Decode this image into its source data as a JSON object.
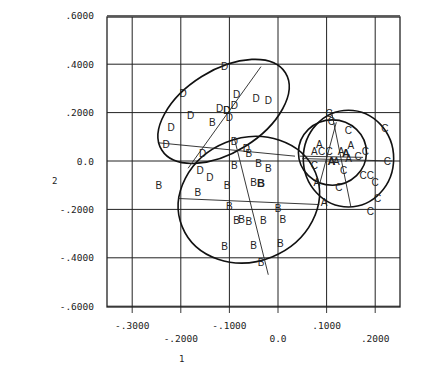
{
  "chart_data": {
    "type": "scatter",
    "title": "",
    "xlabel": "1",
    "ylabel": "2",
    "xlim": [
      -0.35,
      0.25
    ],
    "ylim": [
      -0.6,
      0.6
    ],
    "grid": true,
    "legend": null,
    "x_ticks": [
      {
        "value": -0.3,
        "label": "-.3000",
        "row": 0
      },
      {
        "value": -0.2,
        "label": "-.2000",
        "row": 1
      },
      {
        "value": -0.1,
        "label": "-.1000",
        "row": 0
      },
      {
        "value": 0.0,
        "label": "0.0",
        "row": 1
      },
      {
        "value": 0.1,
        "label": ".1000",
        "row": 0
      },
      {
        "value": 0.2,
        "label": ".2000",
        "row": 1
      }
    ],
    "y_ticks": [
      {
        "value": 0.6,
        "label": ".6000"
      },
      {
        "value": 0.4,
        "label": ".4000"
      },
      {
        "value": 0.2,
        "label": ".2000"
      },
      {
        "value": 0.0,
        "label": "0.0"
      },
      {
        "value": -0.2,
        "label": "-.2000"
      },
      {
        "value": -0.4,
        "label": "-.4000"
      },
      {
        "value": -0.6,
        "label": "-.6000"
      }
    ],
    "series": [
      {
        "name": "D",
        "points": [
          [
            -0.11,
            0.39
          ],
          [
            -0.18,
            0.19
          ],
          [
            -0.22,
            0.14
          ],
          [
            -0.23,
            0.07
          ],
          [
            -0.195,
            0.28
          ],
          [
            -0.12,
            0.215
          ],
          [
            -0.105,
            0.21
          ],
          [
            -0.085,
            0.275
          ],
          [
            -0.09,
            0.23
          ],
          [
            -0.1,
            0.18
          ],
          [
            -0.045,
            0.26
          ],
          [
            -0.02,
            0.25
          ],
          [
            -0.09,
            0.08
          ],
          [
            -0.155,
            0.03
          ],
          [
            -0.065,
            0.05
          ],
          [
            -0.16,
            -0.04
          ],
          [
            -0.14,
            -0.07
          ],
          [
            -0.105,
            0.21
          ]
        ]
      },
      {
        "name": "B",
        "points": [
          [
            -0.135,
            0.16
          ],
          [
            -0.245,
            -0.1
          ],
          [
            -0.165,
            -0.13
          ],
          [
            -0.105,
            -0.1
          ],
          [
            -0.09,
            -0.02
          ],
          [
            -0.06,
            0.03
          ],
          [
            -0.04,
            -0.01
          ],
          [
            -0.02,
            -0.03
          ],
          [
            -0.05,
            -0.09
          ],
          [
            0.0,
            -0.195
          ],
          [
            -0.1,
            -0.19
          ],
          [
            -0.085,
            -0.245
          ],
          [
            -0.075,
            -0.24
          ],
          [
            -0.06,
            -0.25
          ],
          [
            -0.03,
            -0.245
          ],
          [
            0.01,
            -0.24
          ],
          [
            -0.11,
            -0.355
          ],
          [
            -0.05,
            -0.35
          ],
          [
            0.005,
            -0.34
          ],
          [
            -0.035,
            -0.42
          ]
        ],
        "bold_points": [
          [
            -0.035,
            -0.09
          ]
        ]
      },
      {
        "name": "C",
        "points": [
          [
            0.105,
            0.195
          ],
          [
            0.11,
            0.165
          ],
          [
            0.145,
            0.125
          ],
          [
            0.22,
            0.135
          ],
          [
            0.18,
            0.04
          ],
          [
            0.09,
            0.04
          ],
          [
            0.105,
            0.04
          ],
          [
            0.165,
            0.02
          ],
          [
            0.225,
            0.0
          ],
          [
            0.135,
            -0.04
          ],
          [
            0.175,
            -0.06
          ],
          [
            0.19,
            -0.06
          ],
          [
            0.2,
            -0.09
          ],
          [
            0.125,
            -0.11
          ],
          [
            0.205,
            -0.155
          ],
          [
            0.19,
            -0.21
          ],
          [
            0.075,
            -0.02
          ]
        ]
      },
      {
        "name": "A",
        "points": [
          [
            0.085,
            0.07
          ],
          [
            0.075,
            0.04
          ],
          [
            0.13,
            0.04
          ],
          [
            0.15,
            0.065
          ],
          [
            0.12,
            0.0
          ],
          [
            0.145,
            0.01
          ],
          [
            0.08,
            -0.09
          ],
          [
            0.095,
            -0.17
          ]
        ],
        "bold_points": [
          [
            0.11,
            0.0
          ],
          [
            0.14,
            0.035
          ]
        ]
      }
    ],
    "ellipses": [
      {
        "group": "D",
        "cx": -0.112,
        "cy": 0.205,
        "rx": 0.15,
        "ry": 0.17,
        "rotation_deg": -32
      },
      {
        "group": "B",
        "cx": -0.06,
        "cy": -0.16,
        "rx": 0.148,
        "ry": 0.255,
        "rotation_deg": -22
      },
      {
        "group": "C",
        "cx": 0.145,
        "cy": 0.01,
        "rx": 0.093,
        "ry": 0.2,
        "rotation_deg": 0
      },
      {
        "group": "A",
        "cx": 0.112,
        "cy": 0.035,
        "rx": 0.07,
        "ry": 0.135,
        "rotation_deg": 0
      }
    ],
    "axis_segments": [
      {
        "group": "D",
        "x1": -0.245,
        "y1": 0.075,
        "x2": 0.035,
        "y2": 0.02
      },
      {
        "group": "D",
        "x1": -0.035,
        "y1": 0.39,
        "x2": -0.185,
        "y2": -0.03
      },
      {
        "group": "B",
        "x1": -0.205,
        "y1": -0.155,
        "x2": 0.085,
        "y2": -0.18
      },
      {
        "group": "B",
        "x1": -0.09,
        "y1": 0.095,
        "x2": -0.02,
        "y2": -0.47
      },
      {
        "group": "C",
        "x1": 0.05,
        "y1": 0.01,
        "x2": 0.235,
        "y2": 0.0
      },
      {
        "group": "C",
        "x1": 0.11,
        "y1": 0.205,
        "x2": 0.15,
        "y2": -0.19
      },
      {
        "group": "A",
        "x1": 0.045,
        "y1": 0.02,
        "x2": 0.175,
        "y2": 0.015
      },
      {
        "group": "A",
        "x1": 0.12,
        "y1": 0.16,
        "x2": 0.085,
        "y2": -0.1
      }
    ]
  }
}
